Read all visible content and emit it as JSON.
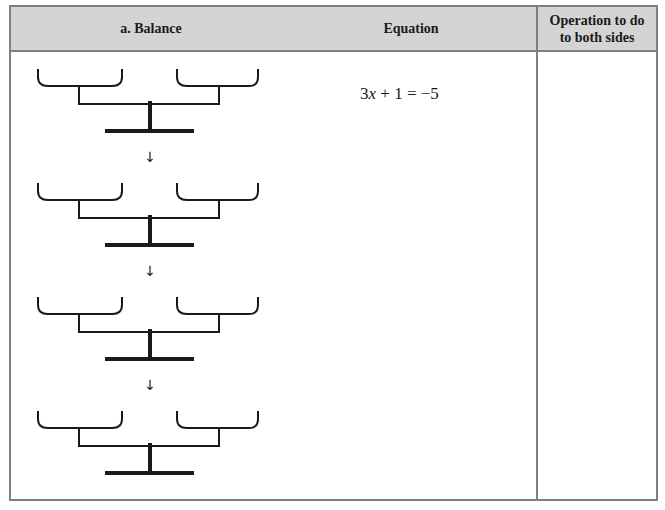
{
  "table": {
    "headers": {
      "balance": "a.  Balance",
      "equation": "Equation",
      "operation": "Operation to do to both sides",
      "operation_line1": "Operation to do",
      "operation_line2": "to both sides"
    },
    "equation": {
      "coef": "3",
      "var": "x",
      "rest": " + 1 = −5"
    },
    "balances": [
      {
        "id": 1,
        "top": 69
      },
      {
        "id": 2,
        "top": 183
      },
      {
        "id": 3,
        "top": 297
      },
      {
        "id": 4,
        "top": 411
      }
    ],
    "arrow_glyph": "↓",
    "colors": {
      "header_bg": "#d4d4d4",
      "border": "#7f7f7f",
      "ink": "#1a1a1a"
    }
  }
}
